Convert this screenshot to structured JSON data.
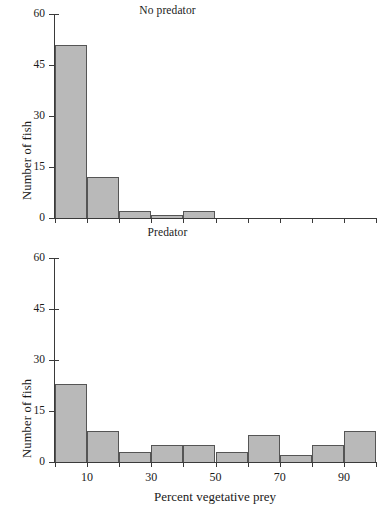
{
  "figure": {
    "background_color": "#ffffff",
    "bar_fill_color": "#b9b9b9",
    "bar_edge_color": "#555555",
    "axis_color": "#3a3a3a",
    "xaxis_title": "Percent vegetative prey"
  },
  "chart_data": [
    {
      "type": "bar",
      "title": "No predator",
      "xlabel": "Percent vegetative prey",
      "ylabel": "Number of fish",
      "grid": false,
      "legend": "none",
      "ylim": [
        0,
        60
      ],
      "ytick_values": [
        0,
        15,
        30,
        45,
        60
      ],
      "ytick_labels": [
        "0",
        "15",
        "30",
        "45",
        "60"
      ],
      "xlim": [
        0,
        100
      ],
      "xtick_values": [
        10,
        30,
        50,
        70,
        90
      ],
      "xtick_labels": [
        "10",
        "30",
        "50",
        "70",
        "90"
      ],
      "bin_edges": [
        0,
        10,
        20,
        30,
        40,
        50,
        60,
        70,
        80,
        90,
        100
      ],
      "categories": [
        "0-10",
        "10-20",
        "20-30",
        "30-40",
        "40-50",
        "50-60",
        "60-70",
        "70-80",
        "80-90",
        "90-100"
      ],
      "values": [
        51,
        12,
        2,
        1,
        2,
        0,
        0,
        0,
        0,
        0
      ]
    },
    {
      "type": "bar",
      "title": "Predator",
      "xlabel": "Percent vegetative prey",
      "ylabel": "Number of fish",
      "grid": false,
      "legend": "none",
      "ylim": [
        0,
        60
      ],
      "ytick_values": [
        0,
        15,
        30,
        45,
        60
      ],
      "ytick_labels": [
        "0",
        "15",
        "30",
        "45",
        "60"
      ],
      "xlim": [
        0,
        100
      ],
      "xtick_values": [
        10,
        30,
        50,
        70,
        90
      ],
      "xtick_labels": [
        "10",
        "30",
        "50",
        "70",
        "90"
      ],
      "bin_edges": [
        0,
        10,
        20,
        30,
        40,
        50,
        60,
        70,
        80,
        90,
        100
      ],
      "categories": [
        "0-10",
        "10-20",
        "20-30",
        "30-40",
        "40-50",
        "50-60",
        "60-70",
        "70-80",
        "80-90",
        "90-100"
      ],
      "values": [
        23,
        9,
        3,
        5,
        5,
        3,
        8,
        2,
        5,
        9
      ]
    }
  ]
}
